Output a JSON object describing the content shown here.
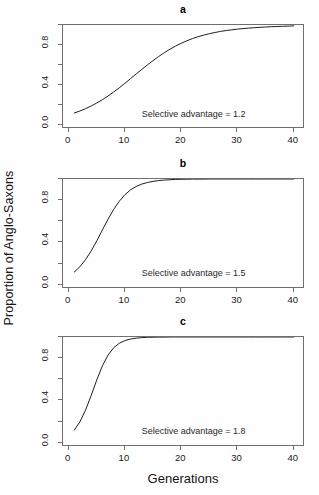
{
  "figure": {
    "background": "#fefefe",
    "line_color": "#1f1f1f",
    "axis_color": "#6f6f6f",
    "xlabel": "Generations",
    "ylabel": "Proportion of Anglo-Saxons"
  },
  "panels": [
    {
      "title": "a",
      "annotation": "Selective advantage = 1.2",
      "selective_advantage": 1.2
    },
    {
      "title": "b",
      "annotation": "Selective advantage = 1.5",
      "selective_advantage": 1.5
    },
    {
      "title": "c",
      "annotation": "Selective advantage = 1.8",
      "selective_advantage": 1.8
    }
  ],
  "axes": {
    "x_ticks": [
      0,
      10,
      20,
      30,
      40
    ],
    "x_tick_labels": [
      "0",
      "10",
      "20",
      "30",
      "40"
    ],
    "x_minor_ticks": [],
    "y_ticks": [
      0.0,
      0.2,
      0.4,
      0.6,
      0.8,
      1.0
    ],
    "y_tick_labels": [
      "0.0",
      "",
      "0.4",
      "",
      "0.8",
      ""
    ],
    "xlim": [
      -1,
      42
    ],
    "ylim": [
      -0.04,
      1.0
    ]
  },
  "chart_data": {
    "type": "line",
    "xlabel": "Generations",
    "ylabel": "Proportion of Anglo-Saxons",
    "xlim": [
      -1,
      42
    ],
    "ylim": [
      -0.04,
      1.0
    ],
    "x_ticks": [
      0,
      10,
      20,
      30,
      40
    ],
    "y_ticks": [
      0.0,
      0.2,
      0.4,
      0.6,
      0.8
    ],
    "grid": false,
    "legend": "none",
    "panel_layout": "3 rows x 1 column",
    "x": [
      1,
      2,
      3,
      4,
      5,
      6,
      7,
      8,
      9,
      10,
      11,
      12,
      13,
      14,
      15,
      16,
      17,
      18,
      19,
      20,
      21,
      22,
      23,
      24,
      25,
      26,
      27,
      28,
      29,
      30,
      31,
      32,
      33,
      34,
      35,
      36,
      37,
      38,
      39,
      40
    ],
    "series": [
      {
        "name": "a: Selective advantage = 1.2",
        "panel": "a",
        "annotation": "Selective advantage = 1.2",
        "values": [
          0.12,
          0.14,
          0.163,
          0.19,
          0.22,
          0.253,
          0.29,
          0.33,
          0.372,
          0.417,
          0.463,
          0.51,
          0.556,
          0.601,
          0.644,
          0.685,
          0.723,
          0.758,
          0.789,
          0.817,
          0.842,
          0.864,
          0.883,
          0.899,
          0.913,
          0.925,
          0.936,
          0.945,
          0.952,
          0.959,
          0.964,
          0.969,
          0.973,
          0.977,
          0.98,
          0.983,
          0.985,
          0.987,
          0.989,
          0.991
        ]
      },
      {
        "name": "b: Selective advantage = 1.5",
        "panel": "b",
        "annotation": "Selective advantage = 1.5",
        "values": [
          0.12,
          0.17,
          0.237,
          0.319,
          0.415,
          0.518,
          0.62,
          0.712,
          0.79,
          0.851,
          0.897,
          0.929,
          0.952,
          0.967,
          0.978,
          0.985,
          0.99,
          0.993,
          0.996,
          0.997,
          0.998,
          0.999,
          0.999,
          0.999,
          1.0,
          1.0,
          1.0,
          1.0,
          1.0,
          1.0,
          1.0,
          1.0,
          1.0,
          1.0,
          1.0,
          1.0,
          1.0,
          1.0,
          1.0,
          1.0
        ]
      },
      {
        "name": "c: Selective advantage = 1.8",
        "panel": "c",
        "annotation": "Selective advantage = 1.8",
        "values": [
          0.12,
          0.197,
          0.308,
          0.446,
          0.594,
          0.727,
          0.829,
          0.898,
          0.941,
          0.966,
          0.981,
          0.989,
          0.994,
          0.997,
          0.998,
          0.999,
          0.999,
          1.0,
          1.0,
          1.0,
          1.0,
          1.0,
          1.0,
          1.0,
          1.0,
          1.0,
          1.0,
          1.0,
          1.0,
          1.0,
          1.0,
          1.0,
          1.0,
          1.0,
          1.0,
          1.0,
          1.0,
          1.0,
          1.0,
          1.0
        ]
      }
    ]
  }
}
